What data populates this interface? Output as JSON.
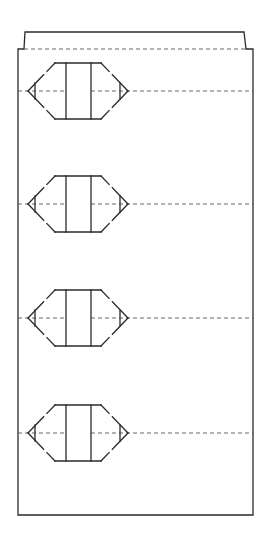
{
  "diagram": {
    "type": "technical-drawing",
    "stroke_color": "#2a2a2a",
    "dash_color": "#555555",
    "background": "#ffffff",
    "outline": {
      "tab_top_y": 32,
      "tab_left_x": 25,
      "tab_right_x": 244,
      "step_y": 49,
      "step_left_x": 24,
      "step_right_x": 246,
      "body_left_x": 18,
      "body_right_x": 253,
      "bottom_y": 515
    },
    "fold_line": {
      "y": 49,
      "x1": 24,
      "x2": 246
    },
    "symbol": {
      "name": "hexagonal-connector-symbol",
      "left_tip_x": 28,
      "left_corner_x": 55,
      "inner_left_x": 66,
      "inner_right_x": 91,
      "right_corner_x": 101,
      "right_tip_x": 128,
      "left_tri_x": 35,
      "right_tri_x": 120,
      "half_height": 28,
      "tri_half_height": 8
    },
    "symbols": [
      {
        "id": 1,
        "center_y": 91
      },
      {
        "id": 2,
        "center_y": 204
      },
      {
        "id": 3,
        "center_y": 318
      },
      {
        "id": 4,
        "center_y": 433
      }
    ]
  }
}
